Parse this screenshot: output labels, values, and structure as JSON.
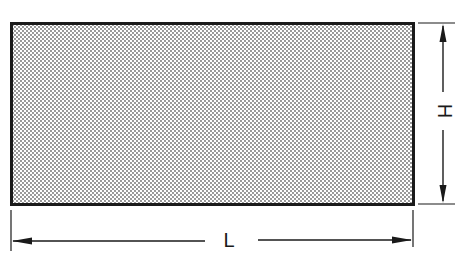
{
  "diagram": {
    "type": "dimensioned-rectangle",
    "shape": {
      "kind": "rectangle",
      "fill_pattern": "dot-stipple",
      "fill_color": "#d8d8d8",
      "dot_color": "#6a6a6a",
      "stroke_color": "#1a1a1a"
    },
    "dimensions": {
      "length": {
        "label": "L",
        "orientation": "horizontal"
      },
      "height": {
        "label": "H",
        "orientation": "vertical"
      }
    }
  }
}
